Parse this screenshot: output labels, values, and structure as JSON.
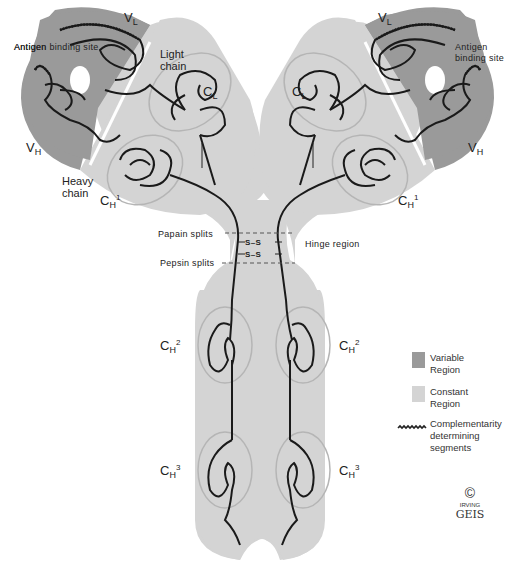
{
  "diagram": {
    "colors": {
      "variable_region": "#9a9a9a",
      "constant_region": "#d4d4d4",
      "domain_outline": "#b8b8b8",
      "chain_line": "#1a1a1a",
      "divider": "#ffffff"
    },
    "labels": {
      "antigen_binding_site_left": "Antigen binding site",
      "antigen_binding_site_right": "Antigen binding site",
      "light_chain": "Light chain",
      "heavy_chain": "Heavy chain",
      "papain_splits": "Papain splits",
      "pepsin_splits": "Pepsin splits",
      "hinge_region": "Hinge region",
      "disulfide": "S–S"
    },
    "domains": {
      "vl": {
        "main": "V",
        "sub": "L"
      },
      "vh": {
        "main": "V",
        "sub": "H"
      },
      "cl": {
        "main": "C",
        "sub": "L"
      },
      "ch1": {
        "main": "C",
        "sub": "H",
        "sup": "1"
      },
      "ch2": {
        "main": "C",
        "sub": "H",
        "sup": "2"
      },
      "ch3": {
        "main": "C",
        "sub": "H",
        "sup": "3"
      }
    },
    "legend": [
      {
        "key": "variable",
        "label": "Variable Region",
        "color": "#9a9a9a"
      },
      {
        "key": "constant",
        "label": "Constant Region",
        "color": "#d4d4d4"
      },
      {
        "key": "cdr",
        "label": "Complementarity determining segments"
      }
    ],
    "signature": {
      "copyright": "©",
      "line1": "IRVING",
      "line2": "GEIS"
    }
  }
}
